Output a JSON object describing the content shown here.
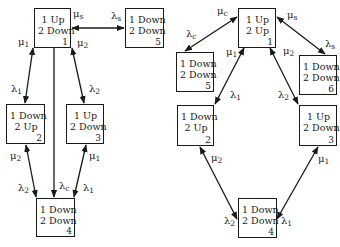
{
  "diagrams": [
    {
      "id": "left",
      "states": [
        {
          "id": 1,
          "line1": "1 Up",
          "line2": "2 Down",
          "num": "1"
        },
        {
          "id": 5,
          "line1": "1 Down",
          "line2": "2 Down",
          "num": "5"
        },
        {
          "id": 2,
          "line1": "1 Down",
          "line2": "2 Up",
          "num": "2"
        },
        {
          "id": 3,
          "line1": "1 Up",
          "line2": "2 Down",
          "num": "3"
        },
        {
          "id": 4,
          "line1": "1 Down",
          "line2": "2 Down",
          "num": "4"
        }
      ],
      "labels": [
        {
          "sym": "μ",
          "sub": "s"
        },
        {
          "sym": "λ",
          "sub": "s"
        },
        {
          "sym": "μ",
          "sub": "1"
        },
        {
          "sym": "μ",
          "sub": "2"
        },
        {
          "sym": "λ",
          "sub": "1"
        },
        {
          "sym": "λ",
          "sub": "2"
        },
        {
          "sym": "μ",
          "sub": "2"
        },
        {
          "sym": "μ",
          "sub": "1"
        },
        {
          "sym": "λ",
          "sub": "2"
        },
        {
          "sym": "λ",
          "sub": "c"
        },
        {
          "sym": "λ",
          "sub": "1"
        }
      ]
    },
    {
      "id": "right",
      "states": [
        {
          "id": 1,
          "line1": "1 Up",
          "line2": "2 Up",
          "num": "1"
        },
        {
          "id": 5,
          "line1": "1 Down",
          "line2": "2 Down",
          "num": "5"
        },
        {
          "id": 6,
          "line1": "1 Down",
          "line2": "2 Down",
          "num": "6"
        },
        {
          "id": 2,
          "line1": "1 Down",
          "line2": "2 Up",
          "num": "2"
        },
        {
          "id": 3,
          "line1": "1 Up",
          "line2": "2 Down",
          "num": "3"
        },
        {
          "id": 4,
          "line1": "1 Down",
          "line2": "2 Down",
          "num": "4"
        }
      ],
      "labels": [
        {
          "sym": "μ",
          "sub": "c"
        },
        {
          "sym": "μ",
          "sub": "s"
        },
        {
          "sym": "λ",
          "sub": "c"
        },
        {
          "sym": "λ",
          "sub": "s"
        },
        {
          "sym": "μ",
          "sub": "1"
        },
        {
          "sym": "μ",
          "sub": "2"
        },
        {
          "sym": "λ",
          "sub": "1"
        },
        {
          "sym": "λ",
          "sub": "2"
        },
        {
          "sym": "μ",
          "sub": "2"
        },
        {
          "sym": "μ",
          "sub": "1"
        },
        {
          "sym": "λ",
          "sub": "2"
        },
        {
          "sym": "λ",
          "sub": "1"
        }
      ]
    }
  ],
  "colors": {
    "ink": "#1a1a1a",
    "background": "#ffffff"
  }
}
